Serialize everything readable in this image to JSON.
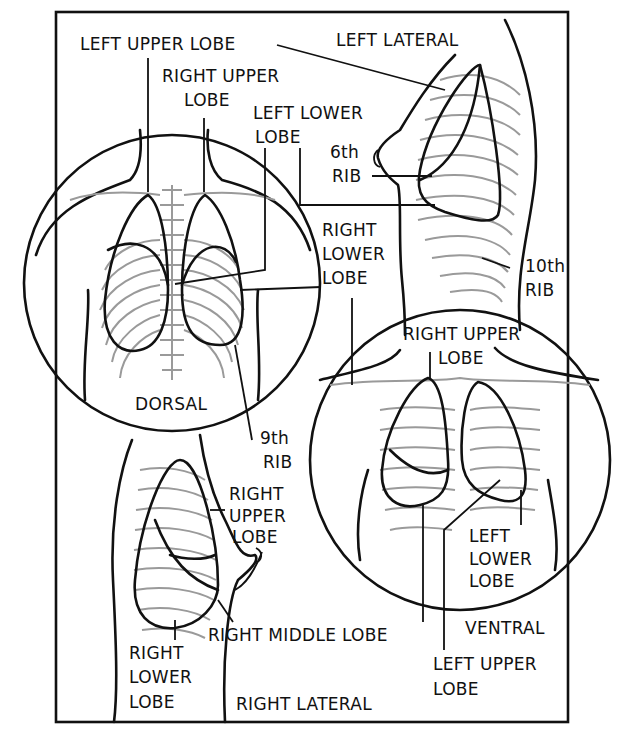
{
  "figure": {
    "colors": {
      "ink": "#111111",
      "bone": "#9a9a9a",
      "background": "#ffffff"
    }
  },
  "views": {
    "left_lateral": {
      "title": "LEFT LATERAL"
    },
    "dorsal": {
      "title": "DORSAL"
    },
    "ventral": {
      "title": "VENTRAL"
    },
    "right_lateral": {
      "title": "RIGHT LATERAL"
    }
  },
  "labels": {
    "left_upper_lobe_top": "LEFT UPPER LOBE",
    "right_upper_lobe_top_1": "RIGHT UPPER",
    "right_upper_lobe_top_2": "LOBE",
    "left_lower_lobe_1": "LEFT LOWER",
    "left_lower_lobe_2": "LOBE",
    "sixth_rib_1": "6th",
    "sixth_rib_2": "RIB",
    "right_lower_lobe_mid_1": "RIGHT",
    "right_lower_lobe_mid_2": "LOWER",
    "right_lower_lobe_mid_3": "LOBE",
    "tenth_rib_1": "10th",
    "tenth_rib_2": "RIB",
    "ninth_rib_1": "9th",
    "ninth_rib_2": "RIB",
    "right_upper_lobe_ventral_1": "RIGHT UPPER",
    "right_upper_lobe_ventral_2": "LOBE",
    "right_upper_lobe_lateral_1": "RIGHT",
    "right_upper_lobe_lateral_2": "UPPER",
    "right_upper_lobe_lateral_3": "LOBE",
    "left_lower_lobe_ventral_1": "LEFT",
    "left_lower_lobe_ventral_2": "LOWER",
    "left_lower_lobe_ventral_3": "LOBE",
    "right_middle_lobe": "RIGHT MIDDLE LOBE",
    "right_lower_lobe_bottom_1": "RIGHT",
    "right_lower_lobe_bottom_2": "LOWER",
    "right_lower_lobe_bottom_3": "LOBE",
    "left_upper_lobe_bottom_1": "LEFT UPPER",
    "left_upper_lobe_bottom_2": "LOBE"
  }
}
